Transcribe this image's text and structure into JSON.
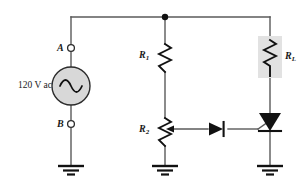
{
  "figure": {
    "type": "circuit-schematic",
    "width": 304,
    "height": 187,
    "background": "#ffffff"
  },
  "colors": {
    "wire": "#4a4a4a",
    "wire_dark": "#2b2b2b",
    "component": "#111111",
    "text": "#1a1a1a",
    "source_fill": "#d8d8d8",
    "highlight_fill": "#e2e2e2",
    "node_fill": "#ffffff"
  },
  "labels": {
    "source": "120 V ac",
    "node_a": "A",
    "node_b": "B",
    "r1": "R",
    "r1_sub": "1",
    "r2": "R",
    "r2_sub": "2",
    "rl": "R",
    "rl_sub": "L"
  },
  "components": [
    {
      "name": "ac-source",
      "label": "120 V ac",
      "kind": "ac-voltage-source"
    },
    {
      "name": "terminal-a",
      "label": "A",
      "kind": "terminal-node"
    },
    {
      "name": "terminal-b",
      "label": "B",
      "kind": "terminal-node"
    },
    {
      "name": "resistor-r1",
      "label": "R1",
      "kind": "resistor"
    },
    {
      "name": "potentiometer-r2",
      "label": "R2",
      "kind": "potentiometer"
    },
    {
      "name": "resistor-rl",
      "label": "RL",
      "kind": "resistor",
      "highlighted": true
    },
    {
      "name": "diode",
      "label": "",
      "kind": "diode"
    },
    {
      "name": "scr",
      "label": "",
      "kind": "silicon-controlled-rectifier"
    },
    {
      "name": "ground-left",
      "label": "",
      "kind": "ground"
    },
    {
      "name": "ground-middle",
      "label": "",
      "kind": "ground"
    },
    {
      "name": "ground-right",
      "label": "",
      "kind": "ground"
    },
    {
      "name": "junction-dot-top",
      "label": "",
      "kind": "junction"
    }
  ]
}
